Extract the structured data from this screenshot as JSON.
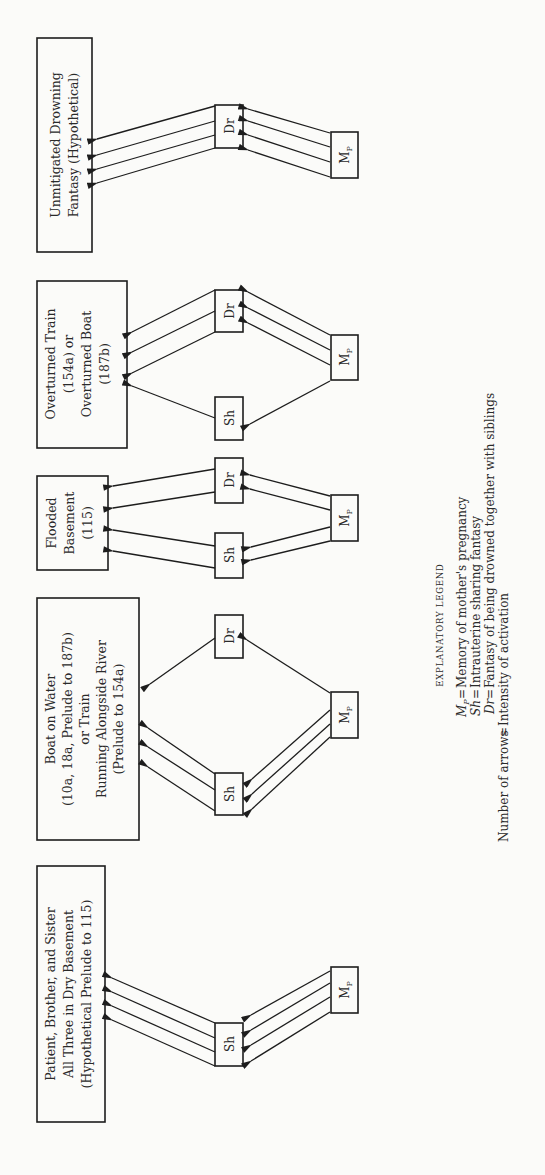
{
  "diagram": {
    "orientation": "rotated 90deg counter-clockwise",
    "panels": [
      {
        "id": "unmitigated",
        "label_lines": [
          "Unmitigated Drowning",
          "Fantasy (Hypothetical)"
        ],
        "nodes": {
          "dr": "Dr",
          "mp": "Mp"
        },
        "arrows": {
          "mp_to_dr": 4,
          "dr_to_label": 4
        }
      },
      {
        "id": "overturned",
        "label_lines": [
          "Overturned Train",
          "(154a) or",
          "Overturned Boat",
          "(187b)"
        ],
        "nodes": {
          "dr": "Dr",
          "sh": "Sh",
          "mp": "Mp"
        },
        "arrows": {
          "mp_to_dr": 3,
          "dr_to_label": 3,
          "mp_to_sh": 1,
          "sh_to_label": 1
        }
      },
      {
        "id": "flooded",
        "label_lines": [
          "Flooded",
          "Basement",
          "(115)"
        ],
        "nodes": {
          "dr": "Dr",
          "sh": "Sh",
          "mp": "Mp"
        },
        "arrows": {
          "mp_to_dr": 2,
          "dr_to_label": 2,
          "mp_to_sh": 2,
          "sh_to_label": 2
        }
      },
      {
        "id": "boat",
        "label_lines": [
          "Boat on Water",
          "(10a, 18a, Prelude to 187b)",
          "or Train",
          "Running Alongside River",
          "(Prelude to 154a)"
        ],
        "nodes": {
          "dr": "Dr",
          "sh": "Sh",
          "mp": "Mp"
        },
        "arrows": {
          "mp_to_dr": 1,
          "dr_to_label": 1,
          "mp_to_sh": 3,
          "sh_to_label": 3
        }
      },
      {
        "id": "patient",
        "label_lines": [
          "Patient, Brother, and Sister",
          "All Three in Dry Basement",
          "(Hypothetical Prelude to 115)"
        ],
        "nodes": {
          "sh": "Sh",
          "mp": "Mp"
        },
        "arrows": {
          "mp_to_sh": 4,
          "sh_to_label": 4
        }
      }
    ],
    "legend": {
      "title": "EXPLANATORY LEGEND",
      "entries": [
        {
          "symbol": "Mp",
          "sep": "=",
          "text": "Memory of mother's pregnancy"
        },
        {
          "symbol": "Sh",
          "sep": "=",
          "text": "Intrauterine sharing fantasy"
        },
        {
          "symbol": "Dr",
          "sep": "=",
          "text": "Fantasy of being drowned together with siblings"
        },
        {
          "symbol": "Number of arrows",
          "sep": "=",
          "text": "Intensity of activation"
        }
      ]
    }
  }
}
